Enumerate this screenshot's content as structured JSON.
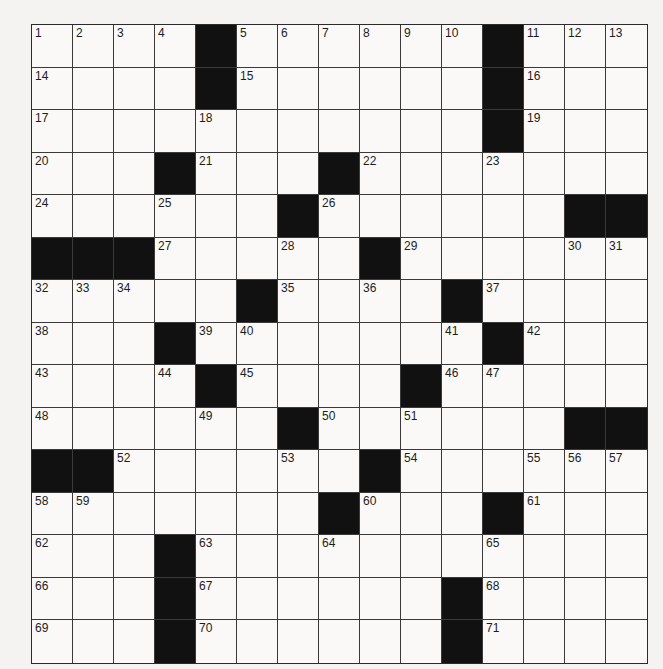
{
  "puzzle": {
    "rows": 15,
    "cols": 15,
    "colors": {
      "black_cell": "#111111",
      "white_cell": "#faf9f7",
      "grid_line": "#3a3a3a",
      "background": "#f4f3f1"
    },
    "layout": [
      "....#......#...",
      "....#......#...",
      "...........#...",
      "...#...#.......",
      "......#......##",
      "###.....#......",
      ".....#....#....",
      "...#.......#...",
      "....#....#.....",
      "......#......##",
      "##......#......",
      ".......#...#...",
      "...#...........",
      "...#......#....",
      "...#......#...."
    ],
    "numbers": [
      [
        1,
        2,
        3,
        4,
        0,
        5,
        6,
        7,
        8,
        9,
        10,
        0,
        11,
        12,
        13
      ],
      [
        14,
        0,
        0,
        0,
        0,
        15,
        0,
        0,
        0,
        0,
        0,
        0,
        16,
        0,
        0
      ],
      [
        17,
        0,
        0,
        0,
        18,
        0,
        0,
        0,
        0,
        0,
        0,
        0,
        19,
        0,
        0
      ],
      [
        20,
        0,
        0,
        0,
        21,
        0,
        0,
        0,
        22,
        0,
        0,
        23,
        0,
        0,
        0
      ],
      [
        24,
        0,
        0,
        25,
        0,
        0,
        0,
        26,
        0,
        0,
        0,
        0,
        0,
        0,
        0
      ],
      [
        0,
        0,
        0,
        27,
        0,
        0,
        28,
        0,
        0,
        29,
        0,
        0,
        0,
        30,
        31
      ],
      [
        32,
        33,
        34,
        0,
        0,
        0,
        35,
        0,
        36,
        0,
        0,
        37,
        0,
        0,
        0
      ],
      [
        38,
        0,
        0,
        0,
        39,
        40,
        0,
        0,
        0,
        0,
        41,
        0,
        42,
        0,
        0
      ],
      [
        43,
        0,
        0,
        44,
        0,
        45,
        0,
        0,
        0,
        0,
        46,
        47,
        0,
        0,
        0
      ],
      [
        48,
        0,
        0,
        0,
        49,
        0,
        0,
        50,
        0,
        51,
        0,
        0,
        0,
        0,
        0
      ],
      [
        0,
        0,
        52,
        0,
        0,
        0,
        53,
        0,
        0,
        54,
        0,
        0,
        55,
        56,
        57
      ],
      [
        58,
        59,
        0,
        0,
        0,
        0,
        0,
        0,
        60,
        0,
        0,
        0,
        61,
        0,
        0
      ],
      [
        62,
        0,
        0,
        0,
        63,
        0,
        0,
        64,
        0,
        0,
        0,
        65,
        0,
        0,
        0
      ],
      [
        66,
        0,
        0,
        0,
        67,
        0,
        0,
        0,
        0,
        0,
        0,
        68,
        0,
        0,
        0
      ],
      [
        69,
        0,
        0,
        0,
        70,
        0,
        0,
        0,
        0,
        0,
        0,
        71,
        0,
        0,
        0
      ]
    ],
    "entries": []
  }
}
